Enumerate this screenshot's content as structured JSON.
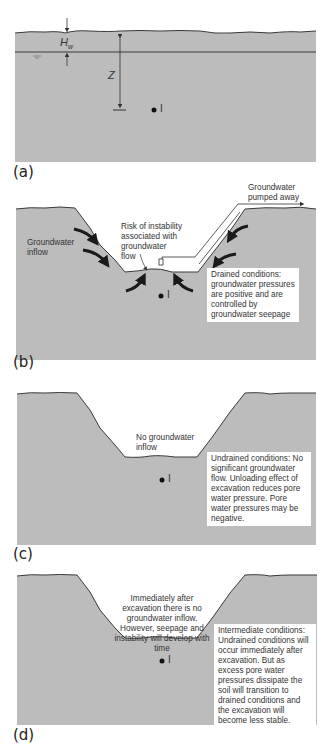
{
  "colors": {
    "soil": "#bcbcbc",
    "outline": "#3a3a3a",
    "background": "#ffffff",
    "text": "#333333"
  },
  "panels": [
    {
      "id": "a",
      "label": "(a)",
      "variables": {
        "hw": "H",
        "hw_sub": "w",
        "z": "Z"
      },
      "element_marker": "I"
    },
    {
      "id": "b",
      "label": "(b)",
      "notes": {
        "pumped": "Groundwater pumped away",
        "inflow": "Groundwater inflow",
        "risk": "Risk of instability associated with groundwater flow",
        "conditions": "Drained conditions: groundwater pressures are positive and are controlled by groundwater seepage"
      },
      "element_marker": "I"
    },
    {
      "id": "c",
      "label": "(c)",
      "notes": {
        "no_inflow": "No groundwater inflow",
        "conditions": "Undrained conditions: No significant groundwater flow. Unloading effect of excavation reduces pore water pressure. Pore water pressures may be negative."
      },
      "element_marker": "I"
    },
    {
      "id": "d",
      "label": "(d)",
      "notes": {
        "immediate": "Immediately after excavation there is no groundwater inflow. However, seepage and instability will develop with time",
        "conditions": "Intermediate conditions: Undrained conditions will occur immediately after excavation. But as excess pore water pressures dissipate the soil will transition to drained conditions and the excavation will become less stable."
      },
      "element_marker": "I"
    }
  ]
}
